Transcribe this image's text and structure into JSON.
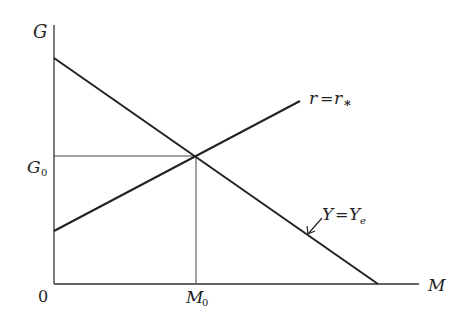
{
  "diagram": {
    "axes": {
      "y_label": "G",
      "x_label": "M",
      "origin_label": "0"
    },
    "ticks": {
      "g0_label": "G",
      "g0_sub": "0",
      "m0_label": "M",
      "m0_sub": "0"
    },
    "curves": {
      "upward": {
        "label_lhs": "r",
        "eq": "=",
        "label_rhs": "r",
        "rhs_sub": "*"
      },
      "downward": {
        "label_lhs": "Y",
        "eq": "=",
        "label_rhs": "Y",
        "rhs_sub": "e"
      }
    },
    "geometry": {
      "y_axis": {
        "x": 54,
        "y_top": 25,
        "y_bottom": 284
      },
      "x_axis": {
        "y": 284,
        "x_left": 54,
        "x_right": 419
      },
      "downward_line": {
        "x1": 54,
        "y1": 58,
        "x2": 378,
        "y2": 284
      },
      "upward_line": {
        "x1": 54,
        "y1": 231,
        "x2": 300,
        "y2": 101
      },
      "intersection": {
        "x": 196,
        "y": 156
      }
    },
    "colors": {
      "line": "#222222",
      "guide": "#444444"
    }
  }
}
